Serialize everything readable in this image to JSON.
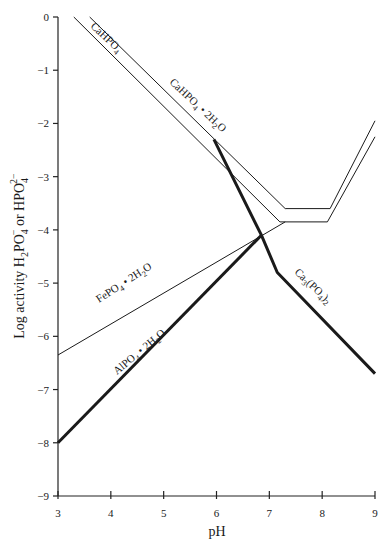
{
  "chart_data": {
    "type": "line",
    "title": "",
    "xlabel": "pH",
    "ylabel": "Log activity H2PO4- or HPO4 2-",
    "ylabel_parts": {
      "prefix": "Log activity H",
      "s1": "2",
      "mid": "PO",
      "s2": "4",
      "sup1": "−",
      "or": " or HPO",
      "s3": "4",
      "sup2": "2−"
    },
    "xlim": [
      3,
      9
    ],
    "ylim": [
      -9,
      0
    ],
    "grid": false,
    "x_ticks": [
      "3",
      "4",
      "5",
      "6",
      "7",
      "8",
      "9"
    ],
    "y_ticks": [
      "0",
      "-1",
      "-2",
      "-3",
      "-4",
      "-5",
      "-6",
      "-7",
      "-8",
      "-9"
    ],
    "series": [
      {
        "name": "CaHPO4",
        "label": "CaHPO",
        "sub": "4",
        "weight": "thin",
        "points": [
          [
            3.3,
            0
          ],
          [
            7.2,
            -3.85
          ],
          [
            8.1,
            -3.85
          ],
          [
            9.0,
            -2.25
          ]
        ]
      },
      {
        "name": "CaHPO4·2H2O",
        "label": "CaHPO",
        "sub": "4",
        "label2": " • 2H",
        "sub2": "2",
        "label3": "O",
        "weight": "thin",
        "points": [
          [
            3.6,
            0
          ],
          [
            7.3,
            -3.6
          ],
          [
            8.15,
            -3.6
          ],
          [
            9.0,
            -1.95
          ]
        ]
      },
      {
        "name": "FePO4·2H2O",
        "label": "FePO",
        "sub": "4",
        "label2": " • 2H",
        "sub2": "2",
        "label3": "O",
        "weight": "thin",
        "points": [
          [
            3.0,
            -6.35
          ],
          [
            7.3,
            -3.85
          ]
        ]
      },
      {
        "name": "AlPO4·2H2O",
        "label": "AlPO",
        "sub": "4",
        "label2": " • 2H",
        "sub2": "2",
        "label3": "O",
        "weight": "thick",
        "points": [
          [
            3.0,
            -8.0
          ],
          [
            6.85,
            -4.1
          ]
        ]
      },
      {
        "name": "Ca3(PO4)2",
        "label": "Ca",
        "sub": "3",
        "label2": "(PO",
        "sub2": "4",
        "label3": ")",
        "sub3": "2",
        "weight": "thick",
        "points": [
          [
            5.95,
            -2.3
          ],
          [
            6.85,
            -4.1
          ],
          [
            7.15,
            -4.8
          ],
          [
            9.0,
            -6.7
          ]
        ]
      }
    ]
  }
}
